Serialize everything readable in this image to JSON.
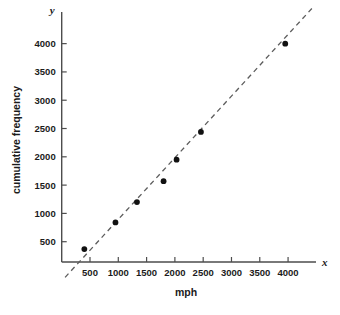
{
  "chart_data": {
    "type": "scatter",
    "title": "",
    "xlabel": "mph",
    "ylabel": "cumulative frequency",
    "x_axis_name": "x",
    "y_axis_name": "y",
    "xlim": [
      0,
      4500
    ],
    "ylim": [
      0,
      4400
    ],
    "xticks": [
      500,
      1000,
      1500,
      2000,
      2500,
      3000,
      3500,
      4000
    ],
    "yticks": [
      500,
      1000,
      1500,
      2000,
      2500,
      3000,
      3500,
      4000
    ],
    "xtick_labels": [
      "500",
      "1000",
      "1500",
      "2000",
      "2500",
      "3000",
      "3500",
      "4000"
    ],
    "ytick_labels": [
      "500",
      "1000",
      "1500",
      "2000",
      "2500",
      "3000",
      "3500",
      "4000"
    ],
    "grid": false,
    "legend": null,
    "series": [
      {
        "name": "observations",
        "marker": "filled-circle",
        "color": "#111111",
        "points": [
          {
            "x": 400,
            "y": 370
          },
          {
            "x": 950,
            "y": 840
          },
          {
            "x": 1330,
            "y": 1200
          },
          {
            "x": 1800,
            "y": 1570
          },
          {
            "x": 2030,
            "y": 1950
          },
          {
            "x": 2460,
            "y": 2440
          },
          {
            "x": 3950,
            "y": 4000
          }
        ]
      },
      {
        "name": "line of best fit",
        "style": "dashed",
        "color": "#5c5c5c",
        "from": {
          "x": 60,
          "y": -130
        },
        "to": {
          "x": 4420,
          "y": 4620
        }
      }
    ]
  },
  "layout": {
    "origin_px": {
      "x": 61.7,
      "y": 270
    },
    "units_per_px": {
      "x": 17.67,
      "y": 17.67
    },
    "axis_top_px": 12,
    "axis_right_px": 316,
    "axis_baseline_px": 262,
    "tick_length_px": 5
  },
  "colors": {
    "axis": "#4d4d4d",
    "text": "#1b1b1b",
    "marker": "#111111",
    "fit_line": "#5c5c5c",
    "background": "#ffffff"
  }
}
